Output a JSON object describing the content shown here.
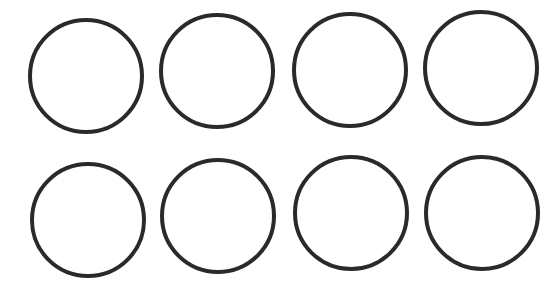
{
  "diagram": {
    "stroke_color": "#2a2a2a",
    "background": "#ffffff",
    "rows": 2,
    "columns": 4,
    "circles": [
      {
        "row": 1,
        "col": 1,
        "cx": 86,
        "cy": 76,
        "r": 58
      },
      {
        "row": 1,
        "col": 2,
        "cx": 217,
        "cy": 71,
        "r": 58
      },
      {
        "row": 1,
        "col": 3,
        "cx": 350,
        "cy": 70,
        "r": 58
      },
      {
        "row": 1,
        "col": 4,
        "cx": 481,
        "cy": 68,
        "r": 58
      },
      {
        "row": 2,
        "col": 1,
        "cx": 88,
        "cy": 220,
        "r": 58
      },
      {
        "row": 2,
        "col": 2,
        "cx": 218,
        "cy": 216,
        "r": 58
      },
      {
        "row": 2,
        "col": 3,
        "cx": 351,
        "cy": 213,
        "r": 58
      },
      {
        "row": 2,
        "col": 4,
        "cx": 482,
        "cy": 213,
        "r": 58
      }
    ]
  }
}
